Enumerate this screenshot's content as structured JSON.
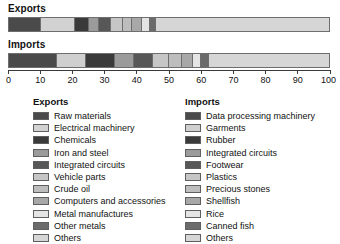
{
  "chart_data": {
    "type": "bar",
    "subtype": "stacked-horizontal-100-percent",
    "title": "",
    "xlabel": "",
    "ylabel": "",
    "xlim": [
      0,
      100
    ],
    "grid": false,
    "legend_position": "bottom",
    "axis_ticks": [
      0,
      10,
      20,
      30,
      40,
      50,
      60,
      70,
      80,
      90,
      100
    ],
    "axis_tick_labels": [
      "0",
      "10",
      "20",
      "30",
      "40",
      "50",
      "60",
      "70",
      "80",
      "90",
      "100"
    ],
    "categories": [
      "Exports",
      "Imports"
    ],
    "series": [
      {
        "name": "Exports",
        "segments": [
          {
            "label": "Raw materials",
            "value": 10.0,
            "color": "#4a4a4a"
          },
          {
            "label": "Electrical machinery",
            "value": 10.5,
            "color": "#d2d2d2"
          },
          {
            "label": "Chemicals",
            "value": 4.5,
            "color": "#3a3a3a"
          },
          {
            "label": "Iron and steel",
            "value": 3.0,
            "color": "#9b9b9b"
          },
          {
            "label": "Integrated circuits",
            "value": 4.0,
            "color": "#575757"
          },
          {
            "label": "Vehicle parts",
            "value": 3.5,
            "color": "#c6c6c6"
          },
          {
            "label": "Crude oil",
            "value": 3.0,
            "color": "#bdbdbd"
          },
          {
            "label": "Computers and accessories",
            "value": 3.0,
            "color": "#a8a8a8"
          },
          {
            "label": "Metal manufactures",
            "value": 2.5,
            "color": "#e4e4e4"
          },
          {
            "label": "Other metals",
            "value": 2.0,
            "color": "#6b6b6b"
          },
          {
            "label": "Others",
            "value": 54.0,
            "color": "#d6d6d6"
          }
        ]
      },
      {
        "name": "Imports",
        "segments": [
          {
            "label": "Data processing machinery",
            "value": 15.0,
            "color": "#4a4a4a"
          },
          {
            "label": "Garments",
            "value": 9.0,
            "color": "#cfcfcf"
          },
          {
            "label": "Rubber",
            "value": 9.0,
            "color": "#3a3a3a"
          },
          {
            "label": "Integrated circuits",
            "value": 6.0,
            "color": "#9b9b9b"
          },
          {
            "label": "Footwear",
            "value": 6.0,
            "color": "#575757"
          },
          {
            "label": "Plastics",
            "value": 5.0,
            "color": "#c6c6c6"
          },
          {
            "label": "Precious stones",
            "value": 4.0,
            "color": "#bdbdbd"
          },
          {
            "label": "Shellfish",
            "value": 3.5,
            "color": "#a8a8a8"
          },
          {
            "label": "Rice",
            "value": 2.5,
            "color": "#e4e4e4"
          },
          {
            "label": "Canned fish",
            "value": 2.5,
            "color": "#6b6b6b"
          },
          {
            "label": "Others",
            "value": 37.5,
            "color": "#d6d6d6"
          }
        ]
      }
    ]
  },
  "headings": {
    "exports": "Exports",
    "imports": "Imports"
  },
  "legend": {
    "exports_heading": "Exports",
    "imports_heading": "Imports"
  }
}
